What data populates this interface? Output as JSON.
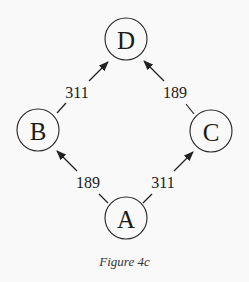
{
  "figure": {
    "caption": "Figure 4c",
    "background": "#f9f9f9",
    "stroke_color": "#222222"
  },
  "nodes": [
    {
      "id": "D",
      "label": "D",
      "cx": 126,
      "cy": 39,
      "r": 21
    },
    {
      "id": "B",
      "label": "B",
      "cx": 38,
      "cy": 130,
      "r": 21
    },
    {
      "id": "C",
      "label": "C",
      "cx": 211,
      "cy": 131,
      "r": 21
    },
    {
      "id": "A",
      "label": "A",
      "cx": 126,
      "cy": 218,
      "r": 21
    }
  ],
  "edges": [
    {
      "from": "B",
      "to": "D",
      "weight": "311",
      "label_x": 77,
      "label_y": 92
    },
    {
      "from": "C",
      "to": "D",
      "weight": "189",
      "label_x": 175,
      "label_y": 92
    },
    {
      "from": "A",
      "to": "B",
      "weight": "189",
      "label_x": 88,
      "label_y": 182
    },
    {
      "from": "A",
      "to": "C",
      "weight": "311",
      "label_x": 163,
      "label_y": 182
    }
  ]
}
